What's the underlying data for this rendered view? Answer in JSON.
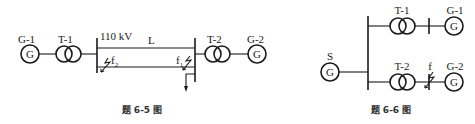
{
  "figure_6_5": {
    "caption": "题 6-5 图",
    "generator_left": {
      "label": "G-1",
      "symbol": "G"
    },
    "transformer_left": {
      "label": "T-1"
    },
    "bus_voltage": "110 kV",
    "line": {
      "label": "L"
    },
    "fault_near": {
      "label": "f",
      "subscript": "2"
    },
    "fault_far": {
      "label": "f",
      "subscript": "1"
    },
    "transformer_right": {
      "label": "T-2"
    },
    "generator_right": {
      "label": "G-2",
      "symbol": "G"
    }
  },
  "figure_6_6": {
    "caption": "题 6-6 图",
    "source": {
      "label": "S",
      "symbol": "G"
    },
    "transformer_top": {
      "label": "T-1"
    },
    "generator_top": {
      "label": "G-1",
      "symbol": "G"
    },
    "transformer_bottom": {
      "label": "T-2"
    },
    "fault": {
      "label": "f"
    },
    "generator_bottom": {
      "label": "G-2",
      "symbol": "G"
    }
  },
  "colors": {
    "stroke": "#1a1a1a",
    "caption": "#333333",
    "background": "#ffffff"
  }
}
